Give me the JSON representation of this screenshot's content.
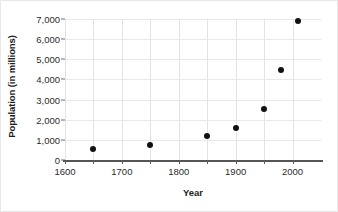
{
  "chart_data": {
    "type": "scatter",
    "title": "",
    "xlabel": "Year",
    "ylabel": "Population (in millions)",
    "xlim": [
      1600,
      2050
    ],
    "ylim": [
      0,
      7000
    ],
    "grid": true,
    "legend_position": "none",
    "x_tick_labels": [
      "1600",
      "1700",
      "1800",
      "1900",
      "2000"
    ],
    "x_tick_values": [
      1600,
      1700,
      1800,
      1900,
      2000
    ],
    "x_minor_gridlines": [
      1600,
      1650,
      1700,
      1750,
      1800,
      1850,
      1900,
      1950,
      2000
    ],
    "y_tick_labels": [
      "0",
      "1,000",
      "2,000",
      "3,000",
      "4,000",
      "5,000",
      "6,000",
      "7,000"
    ],
    "y_tick_values": [
      0,
      1000,
      2000,
      3000,
      4000,
      5000,
      6000,
      7000
    ],
    "x": [
      1650,
      1750,
      1850,
      1900,
      1950,
      1980,
      2010
    ],
    "values": [
      550,
      725,
      1175,
      1600,
      2550,
      4450,
      6900
    ],
    "points": [
      {
        "year": 1650,
        "population": 550
      },
      {
        "year": 1750,
        "population": 725
      },
      {
        "year": 1850,
        "population": 1175
      },
      {
        "year": 1900,
        "population": 1600
      },
      {
        "year": 1950,
        "population": 2550
      },
      {
        "year": 1980,
        "population": 4450
      },
      {
        "year": 2010,
        "population": 6900
      }
    ],
    "marker_color": "#111111",
    "grid_color": "#e3e3e3",
    "axis_color": "#555555"
  }
}
